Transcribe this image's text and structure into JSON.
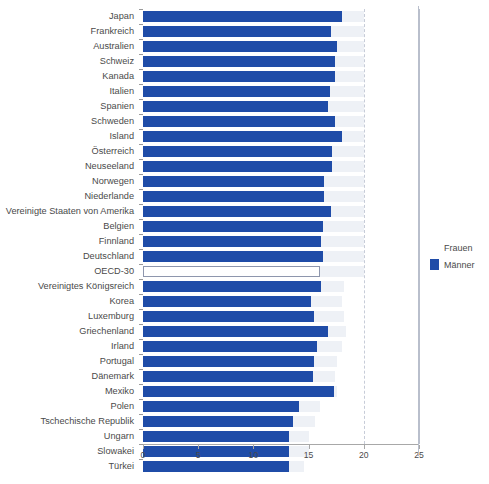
{
  "chart_data": {
    "type": "bar",
    "orientation": "horizontal",
    "title": "",
    "xlabel": "",
    "ylabel": "",
    "xlim": [
      0,
      25
    ],
    "xticks": [
      0,
      5,
      10,
      15,
      20,
      25
    ],
    "xtick_labels": [
      "0",
      "5",
      "10",
      "15",
      "20",
      "25"
    ],
    "grid": false,
    "legend_position": "right",
    "categories": [
      "Japan",
      "Frankreich",
      "Australien",
      "Schweiz",
      "Kanada",
      "Italien",
      "Spanien",
      "Schweden",
      "Island",
      "Österreich",
      "Neuseeland",
      "Norwegen",
      "Niederlande",
      "Vereinigte Staaten von Amerika",
      "Belgien",
      "Finnland",
      "Deutschland",
      "OECD-30",
      "Vereinigtes Königsreich",
      "Korea",
      "Luxemburg",
      "Griechenland",
      "Irland",
      "Portugal",
      "Dänemark",
      "Mexiko",
      "Polen",
      "Tschechische Republik",
      "Ungarn",
      "Slowakei",
      "Türkei"
    ],
    "series": [
      {
        "name": "Frauen",
        "color": "#eef1f6",
        "values": [
          20.0,
          20.0,
          20.0,
          20.0,
          20.0,
          20.0,
          20.0,
          20.0,
          20.0,
          20.0,
          20.0,
          20.0,
          20.0,
          20.0,
          20.0,
          20.0,
          20.0,
          20.0,
          18.2,
          18.0,
          18.2,
          18.4,
          18.0,
          17.6,
          17.4,
          17.6,
          16.0,
          15.6,
          15.0,
          15.0,
          14.6
        ]
      },
      {
        "name": "Männer",
        "color": "#1f4ca8",
        "values": [
          18.0,
          17.0,
          17.6,
          17.4,
          17.4,
          16.9,
          16.8,
          17.4,
          18.0,
          17.1,
          17.1,
          16.4,
          16.4,
          17.0,
          16.3,
          16.1,
          16.3,
          16.0,
          16.1,
          15.2,
          15.5,
          16.8,
          15.8,
          15.5,
          15.4,
          17.3,
          14.1,
          13.6,
          13.2,
          13.2,
          13.2
        ]
      }
    ],
    "highlight_row": "OECD-30",
    "highlight_style": "outlined",
    "reference_lines": [
      {
        "value": 20.0,
        "style": "dashed",
        "color": "#c7ccd8"
      },
      {
        "value": 25.0,
        "style": "solid",
        "color": "#b9bfcc"
      }
    ]
  },
  "legend": {
    "items": [
      {
        "label": "Frauen",
        "swatch": "frauen"
      },
      {
        "label": "Männer",
        "swatch": "maenner"
      }
    ]
  }
}
